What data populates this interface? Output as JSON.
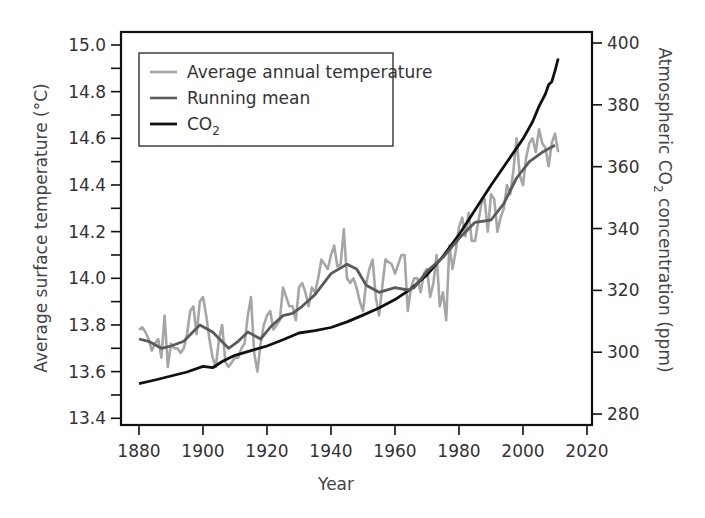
{
  "chart_data": {
    "type": "line",
    "title": "",
    "xlabel": "Year",
    "ylabel": "Average surface temperature (°C)",
    "ylabel_right": "Atmospheric CO2 concentration (ppm)",
    "xlim": [
      1875,
      2022
    ],
    "ylim": [
      13.4,
      15.0
    ],
    "ylim_right": [
      280,
      400
    ],
    "x_ticks": [
      1880,
      1900,
      1920,
      1940,
      1960,
      1980,
      2000,
      2020
    ],
    "y_ticks": [
      13.4,
      13.6,
      13.8,
      14.0,
      14.2,
      14.4,
      14.6,
      14.8,
      15.0
    ],
    "y_ticks_right": [
      280,
      300,
      320,
      340,
      360,
      380,
      400
    ],
    "grid": false,
    "legend_position": "upper left",
    "legend": [
      "Average annual temperature",
      "Running mean",
      "CO2"
    ],
    "series": [
      {
        "name": "Average annual temperature",
        "axis": "left",
        "color": "#a6a6a6",
        "x": [
          1880,
          1881,
          1882,
          1883,
          1884,
          1885,
          1886,
          1887,
          1888,
          1889,
          1890,
          1891,
          1892,
          1893,
          1894,
          1895,
          1896,
          1897,
          1898,
          1899,
          1900,
          1901,
          1902,
          1903,
          1904,
          1905,
          1906,
          1907,
          1908,
          1909,
          1910,
          1911,
          1912,
          1913,
          1914,
          1915,
          1916,
          1917,
          1918,
          1919,
          1920,
          1921,
          1922,
          1923,
          1924,
          1925,
          1926,
          1927,
          1928,
          1929,
          1930,
          1931,
          1932,
          1933,
          1934,
          1935,
          1936,
          1937,
          1938,
          1939,
          1940,
          1941,
          1942,
          1943,
          1944,
          1945,
          1946,
          1947,
          1948,
          1949,
          1950,
          1951,
          1952,
          1953,
          1954,
          1955,
          1956,
          1957,
          1958,
          1959,
          1960,
          1961,
          1962,
          1963,
          1964,
          1965,
          1966,
          1967,
          1968,
          1969,
          1970,
          1971,
          1972,
          1973,
          1974,
          1975,
          1976,
          1977,
          1978,
          1979,
          1980,
          1981,
          1982,
          1983,
          1984,
          1985,
          1986,
          1987,
          1988,
          1989,
          1990,
          1991,
          1992,
          1993,
          1994,
          1995,
          1996,
          1997,
          1998,
          1999,
          2000,
          2001,
          2002,
          2003,
          2004,
          2005,
          2006,
          2007,
          2008,
          2009,
          2010,
          2011
        ],
        "values": [
          13.78,
          13.79,
          13.77,
          13.74,
          13.69,
          13.72,
          13.74,
          13.66,
          13.84,
          13.62,
          13.72,
          13.7,
          13.7,
          13.68,
          13.7,
          13.76,
          13.86,
          13.88,
          13.76,
          13.9,
          13.92,
          13.84,
          13.74,
          13.66,
          13.62,
          13.74,
          13.8,
          13.64,
          13.62,
          13.64,
          13.66,
          13.66,
          13.7,
          13.72,
          13.84,
          13.92,
          13.68,
          13.6,
          13.72,
          13.8,
          13.84,
          13.86,
          13.78,
          13.8,
          13.82,
          13.96,
          13.92,
          13.88,
          13.88,
          13.82,
          13.96,
          13.98,
          13.94,
          13.88,
          13.96,
          13.94,
          14.0,
          14.08,
          14.06,
          14.04,
          14.1,
          14.14,
          14.05,
          14.06,
          14.21,
          14.0,
          13.98,
          14.0,
          13.96,
          13.9,
          13.86,
          13.98,
          14.04,
          14.08,
          13.92,
          13.84,
          13.96,
          14.08,
          14.07,
          14.06,
          14.02,
          14.06,
          14.1,
          14.1,
          13.86,
          13.96,
          14.0,
          14.0,
          13.94,
          14.02,
          14.04,
          13.92,
          13.98,
          14.1,
          13.88,
          13.94,
          13.82,
          14.14,
          14.04,
          14.12,
          14.22,
          14.26,
          14.18,
          14.28,
          14.16,
          14.16,
          14.24,
          14.32,
          14.34,
          14.2,
          14.36,
          14.34,
          14.2,
          14.26,
          14.3,
          14.4,
          14.36,
          14.46,
          14.6,
          14.44,
          14.4,
          14.52,
          14.58,
          14.6,
          14.54,
          14.64,
          14.58,
          14.56,
          14.48,
          14.58,
          14.62,
          14.54
        ]
      },
      {
        "name": "Running mean",
        "axis": "left",
        "color": "#5a5a5a",
        "x": [
          1880,
          1883,
          1887,
          1890,
          1894,
          1899,
          1903,
          1908,
          1911,
          1914,
          1918,
          1921,
          1925,
          1928,
          1931,
          1935,
          1940,
          1945,
          1948,
          1951,
          1955,
          1960,
          1964,
          1966,
          1970,
          1975,
          1980,
          1985,
          1990,
          1994,
          1998,
          2002,
          2006,
          2010
        ],
        "values": [
          13.74,
          13.73,
          13.7,
          13.71,
          13.73,
          13.8,
          13.77,
          13.7,
          13.73,
          13.77,
          13.74,
          13.79,
          13.84,
          13.85,
          13.88,
          13.93,
          14.02,
          14.06,
          14.04,
          13.97,
          13.94,
          13.96,
          13.95,
          13.96,
          14.03,
          14.09,
          14.17,
          14.24,
          14.25,
          14.32,
          14.43,
          14.5,
          14.54,
          14.57
        ]
      },
      {
        "name": "CO2",
        "axis": "right",
        "color": "#111111",
        "x": [
          1880,
          1885,
          1890,
          1895,
          1900,
          1903,
          1906,
          1910,
          1915,
          1920,
          1925,
          1930,
          1935,
          1940,
          1945,
          1950,
          1955,
          1960,
          1965,
          1970,
          1975,
          1980,
          1985,
          1990,
          1995,
          2000,
          2003,
          2005,
          2007,
          2008,
          2009,
          2010,
          2011
        ],
        "values": [
          289.8,
          291.0,
          292.3,
          293.6,
          295.4,
          295.0,
          297.0,
          299.0,
          300.5,
          302.0,
          304.0,
          306.2,
          307.0,
          308.0,
          309.8,
          312.0,
          314.3,
          317.0,
          320.5,
          325.0,
          331.0,
          338.0,
          346.0,
          354.0,
          361.5,
          369.0,
          374.5,
          379.5,
          383.5,
          386.5,
          387.5,
          391.0,
          395.0
        ]
      }
    ]
  },
  "axes": {
    "left": {
      "title": "Average surface temperature (°C)",
      "ticks": [
        "15.0",
        "14.8",
        "14.6",
        "14.4",
        "14.2",
        "14.0",
        "13.8",
        "13.6",
        "13.4"
      ]
    },
    "right": {
      "title_prefix": "Atmospheric CO",
      "title_sub": "2",
      "title_suffix": " concentration (ppm)",
      "ticks": [
        "400",
        "380",
        "360",
        "340",
        "320",
        "300",
        "280"
      ]
    },
    "bottom": {
      "title": "Year",
      "ticks": [
        "1880",
        "1900",
        "1920",
        "1940",
        "1960",
        "1980",
        "2000",
        "2020"
      ]
    }
  },
  "legend": {
    "items": [
      {
        "label": "Average annual temperature",
        "color": "#a6a6a6"
      },
      {
        "label": "Running mean",
        "color": "#5a5a5a"
      },
      {
        "label_prefix": "CO",
        "label_sub": "2",
        "color": "#111111"
      }
    ]
  },
  "colors": {
    "frame": "#111111",
    "annual": "#a6a6a6",
    "running_mean": "#5a5a5a",
    "co2": "#111111"
  }
}
